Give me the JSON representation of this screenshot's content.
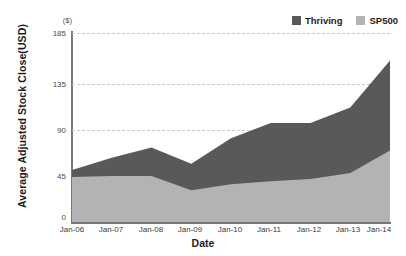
{
  "chart_data": {
    "type": "area",
    "stacked": true,
    "title": "",
    "xlabel": "Date",
    "ylabel": "Average Adjusted Stock Close(USD)",
    "y_unit": "($)",
    "categories": [
      "Jan-06",
      "Jan-07",
      "Jan-08",
      "Jan-09",
      "Jan-10",
      "Jan-11",
      "Jan-12",
      "Jan-13",
      "Jan-14"
    ],
    "yticks": [
      0,
      45,
      90,
      135,
      185
    ],
    "ylim": [
      0,
      185
    ],
    "grid": true,
    "legend_position": "top-right",
    "series": [
      {
        "name": "Thriving",
        "color": "#595959",
        "values": [
          51,
          63,
          73,
          57,
          82,
          97,
          97,
          112,
          158
        ]
      },
      {
        "name": "SP500",
        "color": "#b3b3b3",
        "values": [
          44,
          45,
          45,
          31,
          37,
          40,
          42,
          48,
          70
        ]
      }
    ]
  },
  "legend": {
    "items": [
      {
        "label": "Thriving",
        "color": "#595959"
      },
      {
        "label": "SP500",
        "color": "#b3b3b3"
      }
    ]
  },
  "axes": {
    "x_title": "Date",
    "y_title": "Average Adjusted Stock Close(USD)",
    "y_unit": "($)",
    "y_ticks": [
      "185",
      "135",
      "90",
      "45",
      "0"
    ],
    "x_ticks": [
      "Jan-06",
      "Jan-07",
      "Jan-08",
      "Jan-09",
      "Jan-10",
      "Jan-11",
      "Jan-12",
      "Jan-13",
      "Jan-14"
    ]
  },
  "colors": {
    "thriving": "#595959",
    "sp500": "#b3b3b3",
    "grid": "#c9c9c9",
    "axis": "#777777",
    "text": "#1d1d1d"
  }
}
